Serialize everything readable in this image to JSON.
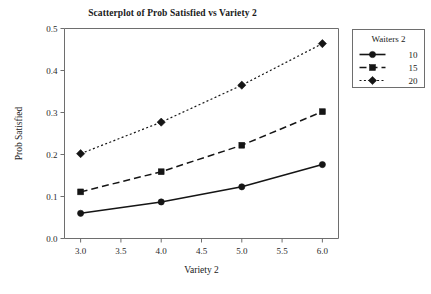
{
  "chart_data": {
    "type": "line",
    "title": "Scatterplot of Prob Satisfied vs Variety 2",
    "xlabel": "Variety 2",
    "ylabel": "Prob Satisfied",
    "x": [
      3.0,
      4.0,
      5.0,
      6.0
    ],
    "xlim": [
      2.8,
      6.2
    ],
    "ylim": [
      0.0,
      0.5
    ],
    "xticks": [
      "3.0",
      "3.5",
      "4.0",
      "4.5",
      "5.0",
      "5.5",
      "6.0"
    ],
    "xtick_values": [
      3.0,
      3.5,
      4.0,
      4.5,
      5.0,
      5.5,
      6.0
    ],
    "yticks": [
      "0.0",
      "0.1",
      "0.2",
      "0.3",
      "0.4",
      "0.5"
    ],
    "ytick_values": [
      0.0,
      0.1,
      0.2,
      0.3,
      0.4,
      0.5
    ],
    "grid": false,
    "legend_position": "right",
    "legend_title": "Waiters 2",
    "series": [
      {
        "name": "10",
        "values": [
          0.06,
          0.087,
          0.123,
          0.176
        ],
        "marker": "circle",
        "linestyle": "solid",
        "color": "#151515"
      },
      {
        "name": "15",
        "values": [
          0.111,
          0.159,
          0.222,
          0.302
        ],
        "marker": "square",
        "linestyle": "dashed",
        "color": "#151515"
      },
      {
        "name": "20",
        "values": [
          0.202,
          0.277,
          0.365,
          0.464
        ],
        "marker": "diamond",
        "linestyle": "dotted",
        "color": "#151515"
      }
    ]
  },
  "page": {
    "background": "#ffffff",
    "axis_color": "#6e6e6e",
    "ink_color": "#151515"
  }
}
